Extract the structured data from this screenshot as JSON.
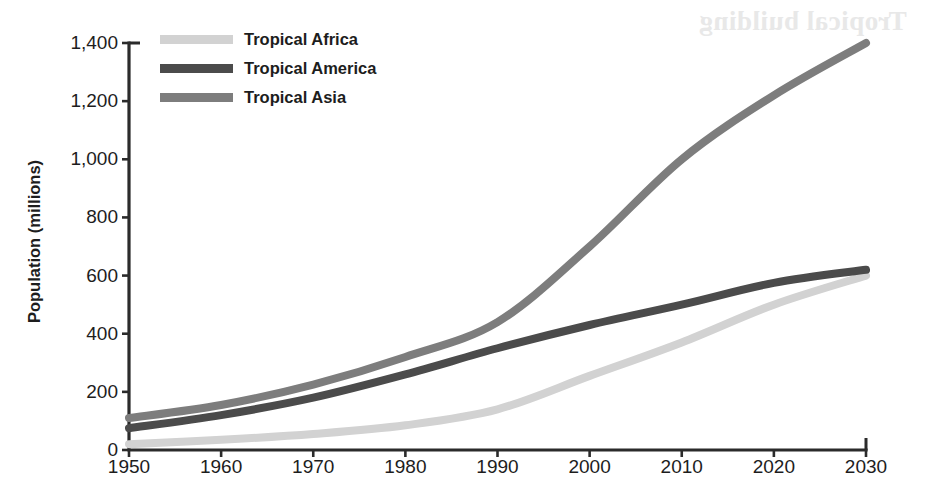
{
  "ghost": {
    "bleed_text": "Tropical building"
  },
  "chart_data": {
    "type": "line",
    "title": "",
    "xlabel": "",
    "ylabel": "Population (millions)",
    "xlim": [
      1950,
      2030
    ],
    "ylim": [
      0,
      1400
    ],
    "ytick_step": 200,
    "xtick_step": 10,
    "grid": false,
    "legend_position": "top-left",
    "x": [
      1950,
      1960,
      1970,
      1980,
      1990,
      2000,
      2010,
      2020,
      2030
    ],
    "xtick_labels": [
      "1950",
      "1960",
      "1970",
      "1980",
      "1990",
      "2000",
      "2010",
      "2020",
      "2030"
    ],
    "ytick_labels": [
      "0",
      "200",
      "400",
      "600",
      "800",
      "1,000",
      "1,200",
      "1,400"
    ],
    "ytick_values": [
      0,
      200,
      400,
      600,
      800,
      1000,
      1200,
      1400
    ],
    "series": [
      {
        "name": "Tropical Africa",
        "color": "#d2d2d2",
        "values": [
          20,
          35,
          55,
          85,
          140,
          255,
          370,
          500,
          600
        ]
      },
      {
        "name": "Tropical America",
        "color": "#4b4b4b",
        "values": [
          75,
          120,
          180,
          260,
          350,
          430,
          500,
          575,
          620
        ]
      },
      {
        "name": "Tropical Asia",
        "color": "#7d7d7d",
        "values": [
          110,
          155,
          225,
          320,
          440,
          700,
          1000,
          1220,
          1400
        ]
      }
    ]
  },
  "axis": {
    "line_color": "#2b2b2b"
  }
}
